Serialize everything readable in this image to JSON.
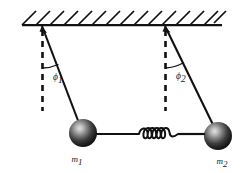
{
  "figure": {
    "background_color": "#ffffff",
    "ink_color": "#111111"
  },
  "ceiling": {
    "name": "hatched-ceiling",
    "hatch_count": 14,
    "line_y": 25,
    "x_start": 22,
    "x_end": 222
  },
  "pendulums": [
    {
      "id": "left",
      "pivot_label": "pivot-1",
      "mass_label": "m",
      "mass_subscript": "1",
      "angle_label": "ϕ",
      "angle_subscript": "1",
      "pivot_x": 42,
      "pivot_y": 26,
      "bob_x": 83,
      "bob_y": 133,
      "bob_radius": 14
    },
    {
      "id": "right",
      "pivot_label": "pivot-2",
      "mass_label": "m",
      "mass_subscript": "2",
      "angle_label": "ϕ",
      "angle_subscript": "2",
      "pivot_x": 165,
      "pivot_y": 26,
      "bob_x": 218,
      "bob_y": 136,
      "bob_radius": 14
    }
  ],
  "spring": {
    "name": "coupling-spring",
    "coil_count": 5,
    "x_start": 97,
    "x_end": 204,
    "y": 134
  },
  "colors": {
    "bob_highlight": "#d8d8d8",
    "bob_mid": "#4a4a4a",
    "bob_dark": "#111111",
    "ink": "#111111"
  }
}
